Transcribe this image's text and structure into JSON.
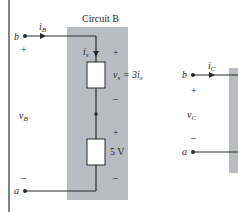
{
  "circuit_b": {
    "title": "Circuit B",
    "terminal_top": "b",
    "terminal_bottom": "a",
    "current_label": "i",
    "current_sub": "B",
    "voltage_label": "v",
    "voltage_sub": "B",
    "plus": "+",
    "minus": "–",
    "branch_current": "i",
    "branch_current_sub": "s",
    "dependent_source": {
      "label_v": "v",
      "label_sub": "s",
      "label_eq": " = 3i",
      "label_eq_sub": "s",
      "plus": "+",
      "minus": "–"
    },
    "independent_source": {
      "label": "5 V",
      "plus": "+",
      "minus": "–"
    }
  },
  "circuit_c": {
    "terminal_top": "b",
    "terminal_bottom": "a",
    "current_label": "i",
    "current_sub": "C",
    "voltage_label": "v",
    "voltage_sub": "C",
    "plus": "+",
    "minus": "–"
  },
  "colors": {
    "box_fill": "#b9bcc2",
    "wire": "#2a2a2a",
    "left_rule": "#55585e"
  }
}
